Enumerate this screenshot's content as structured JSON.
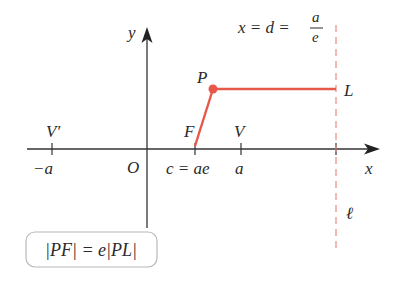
{
  "diagram": {
    "type": "ellipse-focus-directrix",
    "colors": {
      "axis": "#333333",
      "accent": "#e8584a",
      "directrix": "#e88a84",
      "text": "#2a2a2a",
      "box_border": "#b8b8b8"
    },
    "axes": {
      "x_label": "x",
      "y_label": "y",
      "origin_label": "O"
    },
    "points": {
      "vertex_left": "V′",
      "vertex_left_coord": "−a",
      "focus": "F",
      "focus_coord": "c = ae",
      "vertex_right": "V",
      "vertex_right_coord": "a",
      "point": "P",
      "point_on_directrix": "L"
    },
    "directrix": {
      "equation_prefix": "x = d =",
      "frac_num": "a",
      "frac_den": "e",
      "line_label": "ℓ"
    },
    "formula": {
      "text": "|PF| = e|PL|"
    }
  }
}
